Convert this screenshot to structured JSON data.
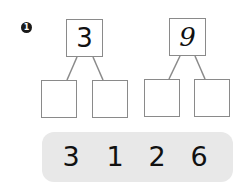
{
  "problem": {
    "number": "1",
    "bonds": [
      {
        "whole": "3",
        "parts": [
          "",
          ""
        ]
      },
      {
        "whole": "9",
        "parts": [
          "",
          ""
        ]
      }
    ],
    "number_bank": [
      "3",
      "1",
      "2",
      "6"
    ]
  },
  "colors": {
    "box_border": "#8a8a8a",
    "bank_background": "#e8e8e8",
    "text": "#111111"
  }
}
